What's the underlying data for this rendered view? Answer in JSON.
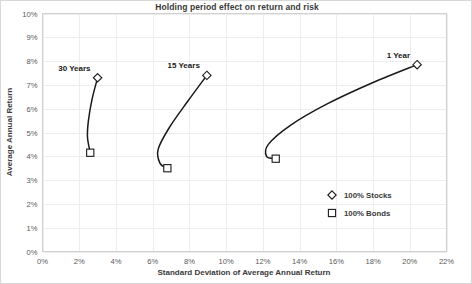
{
  "chart_data": {
    "type": "line",
    "title": "Holding period effect on return and risk",
    "xlabel": "Standard Deviation of Average Annual Return",
    "ylabel": "Average Annual Return",
    "xlim": [
      0,
      22
    ],
    "ylim": [
      0,
      10
    ],
    "grid": true,
    "legend_position": "inside-bottom-right",
    "x_tick_labels": [
      "0%",
      "2%",
      "4%",
      "6%",
      "8%",
      "10%",
      "12%",
      "14%",
      "16%",
      "18%",
      "20%",
      "22%"
    ],
    "x_tick_values": [
      0,
      2,
      4,
      6,
      8,
      10,
      12,
      14,
      16,
      18,
      20,
      22
    ],
    "y_tick_labels": [
      "0%",
      "1%",
      "2%",
      "3%",
      "4%",
      "5%",
      "6%",
      "7%",
      "8%",
      "9%",
      "10%"
    ],
    "y_tick_values": [
      0,
      1,
      2,
      3,
      4,
      5,
      6,
      7,
      8,
      9,
      10
    ],
    "legend": [
      {
        "label": "100% Stocks",
        "marker": "diamond"
      },
      {
        "label": "100% Bonds",
        "marker": "square"
      }
    ],
    "series": [
      {
        "name": "30 Years",
        "annotation": "30 Years",
        "stocks_point": {
          "x": 3.0,
          "y": 7.3
        },
        "bonds_point": {
          "x": 2.6,
          "y": 4.15
        },
        "curve": [
          {
            "x": 3.0,
            "y": 7.3
          },
          {
            "x": 2.7,
            "y": 6.4
          },
          {
            "x": 2.5,
            "y": 5.5
          },
          {
            "x": 2.45,
            "y": 4.8
          },
          {
            "x": 2.6,
            "y": 4.15
          }
        ]
      },
      {
        "name": "15 Years",
        "annotation": "15 Years",
        "stocks_point": {
          "x": 8.95,
          "y": 7.4
        },
        "bonds_point": {
          "x": 6.8,
          "y": 3.5
        },
        "curve": [
          {
            "x": 8.95,
            "y": 7.4
          },
          {
            "x": 7.9,
            "y": 6.3
          },
          {
            "x": 6.9,
            "y": 5.2
          },
          {
            "x": 6.3,
            "y": 4.3
          },
          {
            "x": 6.4,
            "y": 3.7
          },
          {
            "x": 6.8,
            "y": 3.5
          }
        ]
      },
      {
        "name": "1 Year",
        "annotation": "1 Year",
        "stocks_point": {
          "x": 20.4,
          "y": 7.85
        },
        "bonds_point": {
          "x": 12.7,
          "y": 3.9
        },
        "curve": [
          {
            "x": 20.4,
            "y": 7.85
          },
          {
            "x": 18.0,
            "y": 7.1
          },
          {
            "x": 15.5,
            "y": 6.2
          },
          {
            "x": 13.5,
            "y": 5.3
          },
          {
            "x": 12.3,
            "y": 4.5
          },
          {
            "x": 12.2,
            "y": 4.0
          },
          {
            "x": 12.7,
            "y": 3.9
          }
        ]
      }
    ],
    "colors": {
      "line": "#1a1a1a",
      "marker_fill": "#ffffff",
      "grid": "#ededed",
      "text": "#3a3a3a",
      "background": "#ffffff"
    }
  }
}
